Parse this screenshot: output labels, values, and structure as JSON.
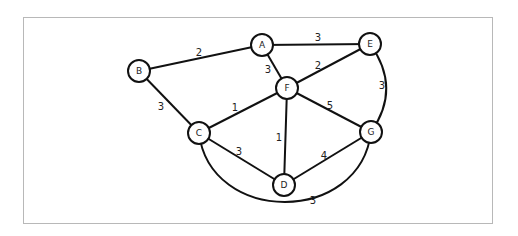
{
  "diagram": {
    "type": "weighted-undirected-graph",
    "nodes": [
      {
        "id": "A",
        "label": "A",
        "x": 262,
        "y": 45
      },
      {
        "id": "E",
        "label": "E",
        "x": 370,
        "y": 44
      },
      {
        "id": "B",
        "label": "B",
        "x": 139,
        "y": 71
      },
      {
        "id": "F",
        "label": "F",
        "x": 287,
        "y": 88
      },
      {
        "id": "C",
        "label": "C",
        "x": 199,
        "y": 133
      },
      {
        "id": "G",
        "label": "G",
        "x": 371,
        "y": 132
      },
      {
        "id": "D",
        "label": "D",
        "x": 284,
        "y": 185
      }
    ],
    "edges": [
      {
        "from": "B",
        "to": "A",
        "weight": "2",
        "lx": 199,
        "ly": 52
      },
      {
        "from": "A",
        "to": "E",
        "weight": "3",
        "lx": 318,
        "ly": 37
      },
      {
        "from": "A",
        "to": "F",
        "weight": "3",
        "lx": 268,
        "ly": 69
      },
      {
        "from": "F",
        "to": "E",
        "weight": "2",
        "lx": 318,
        "ly": 65
      },
      {
        "from": "E",
        "to": "G",
        "weight": "3",
        "lx": 382,
        "ly": 85
      },
      {
        "from": "B",
        "to": "C",
        "weight": "3",
        "lx": 161,
        "ly": 106
      },
      {
        "from": "C",
        "to": "F",
        "weight": "1",
        "lx": 235,
        "ly": 107
      },
      {
        "from": "F",
        "to": "G",
        "weight": "5",
        "lx": 330,
        "ly": 105
      },
      {
        "from": "F",
        "to": "D",
        "weight": "1",
        "lx": 279,
        "ly": 137
      },
      {
        "from": "C",
        "to": "D",
        "weight": "3",
        "lx": 239,
        "ly": 151
      },
      {
        "from": "D",
        "to": "G",
        "weight": "4",
        "lx": 324,
        "ly": 155
      },
      {
        "from": "C",
        "to": "G",
        "weight": "3",
        "lx": 313,
        "ly": 200
      }
    ]
  }
}
